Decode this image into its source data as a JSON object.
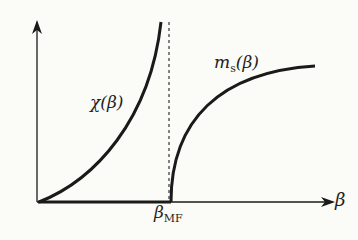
{
  "diagram": {
    "labels": {
      "chi": "χ(β)",
      "ms_main": "m",
      "ms_sub": "s",
      "ms_arg": "(β)",
      "beta_mf_main": "β",
      "beta_mf_sub": "MF",
      "x_axis": "β"
    },
    "colors": {
      "line": "#1a1a1a",
      "background": "#fbfbf7"
    }
  }
}
